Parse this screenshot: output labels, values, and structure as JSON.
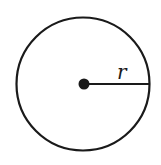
{
  "diagram": {
    "shape": "circle",
    "center": {
      "x": 84,
      "y": 84
    },
    "radius_px": 67,
    "radius_label": "r",
    "colors": {
      "stroke": "#1a1a1a",
      "background": "#ffffff"
    }
  }
}
